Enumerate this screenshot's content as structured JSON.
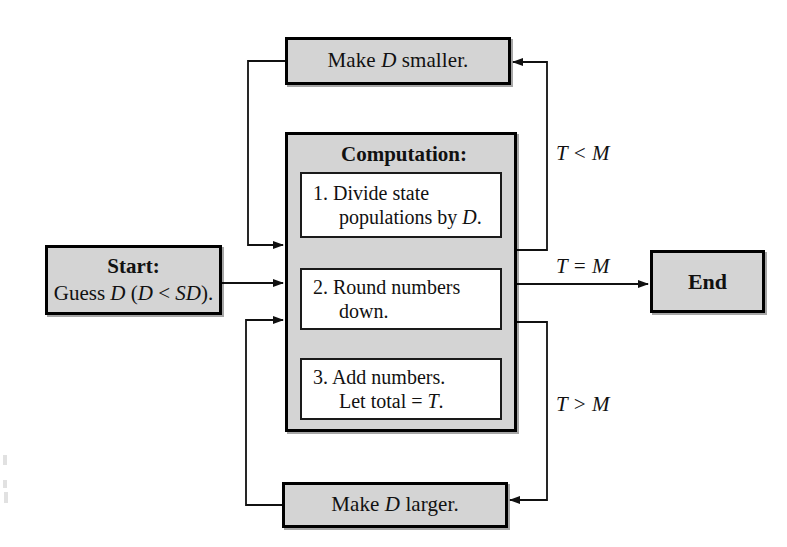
{
  "diagram": {
    "colors": {
      "shaded_fill": "#d4d4d4",
      "plain_fill": "#ffffff",
      "stroke": "#000000",
      "background": "#ffffff"
    },
    "nodes": {
      "make_smaller": {
        "label": "Make D smaller.",
        "text_plain": "Make ",
        "italic_var": "D",
        "text_tail": " smaller."
      },
      "make_larger": {
        "label": "Make D larger.",
        "text_plain": "Make ",
        "italic_var": "D",
        "text_tail": " larger."
      },
      "start": {
        "heading": "Start:",
        "body_lead": "Guess ",
        "body_var": "D",
        "body_mid": " (",
        "body_var2": "D",
        "body_rel": " < ",
        "body_var3": "SD",
        "body_tail": ")."
      },
      "end": {
        "label": "End"
      },
      "computation": {
        "title": "Computation:",
        "steps": [
          {
            "number": "1.",
            "line1": "Divide state",
            "line2_lead": "populations by ",
            "line2_var": "D",
            "line2_tail": "."
          },
          {
            "number": "2.",
            "line1": "Round numbers",
            "line2_lead": "down.",
            "line2_var": "",
            "line2_tail": ""
          },
          {
            "number": "3.",
            "line1": "Add numbers.",
            "line2_lead": "Let total = ",
            "line2_var": "T",
            "line2_tail": "."
          }
        ]
      }
    },
    "edge_labels": {
      "less_than": "T < M",
      "equal": "T = M",
      "greater_than": "T > M"
    }
  }
}
